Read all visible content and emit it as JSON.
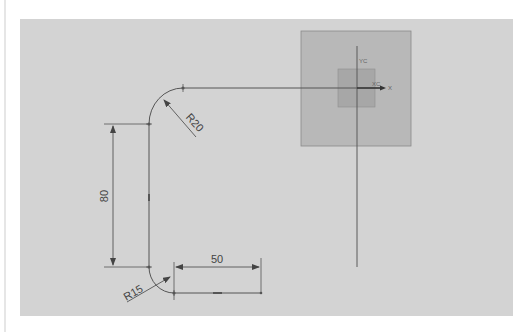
{
  "canvas": {
    "background": "#d3d3d3",
    "line_color": "#555555",
    "dimension_color": "#444444"
  },
  "csys": {
    "outer_square_color": "#b8b8b8",
    "inner_square_color": "#a7a7a7",
    "y_label": "YC",
    "x_label": "XC",
    "x_axis_label": "X"
  },
  "dimensions": {
    "vertical_length": "80",
    "horizontal_length": "50",
    "top_radius": "R20",
    "bottom_radius": "R15"
  }
}
